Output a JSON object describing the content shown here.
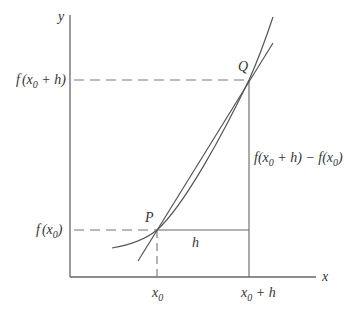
{
  "diagram": {
    "colors": {
      "line": "#555555",
      "axis": "#666666",
      "text": "#333333",
      "background": "#ffffff"
    },
    "axes": {
      "x_label": "x",
      "y_label": "y"
    },
    "points": [
      {
        "name": "P",
        "label": "P"
      },
      {
        "name": "Q",
        "label": "Q"
      }
    ],
    "y_ticks": [
      {
        "label_f": "f",
        "label_open": "(x",
        "label_sub": "0",
        "label_rest": " + h)"
      },
      {
        "label_f": "f",
        "label_open": "(x",
        "label_sub": "0",
        "label_rest": ")"
      }
    ],
    "x_ticks": [
      {
        "label_main": "x",
        "label_sub": "0",
        "label_rest": ""
      },
      {
        "label_main": "x",
        "label_sub": "0",
        "label_rest": " + h"
      }
    ],
    "annotations": {
      "h": "h",
      "rise": {
        "part1": "f(x",
        "sub1": "0",
        "part2": " + h) − f(x",
        "sub2": "0",
        "part3": ")"
      }
    }
  }
}
